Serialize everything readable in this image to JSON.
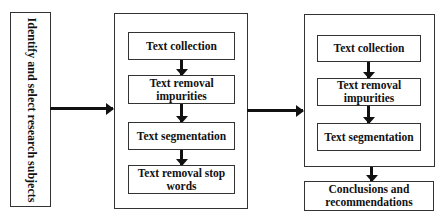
{
  "diagram": {
    "start": {
      "label": "Identify and select research subjects"
    },
    "middle_group": {
      "steps": [
        {
          "label": "Text collection"
        },
        {
          "label": "Text removal impurities"
        },
        {
          "label": "Text segmentation"
        },
        {
          "label": "Text removal stop words"
        }
      ]
    },
    "right_group": {
      "steps": [
        {
          "label": "Text collection"
        },
        {
          "label": "Text removal impurities"
        },
        {
          "label": "Text segmentation"
        }
      ]
    },
    "end": {
      "label": "Conclusions and recommendations"
    },
    "colors": {
      "stroke": "#333333",
      "arrow": "#111111",
      "background": "#ffffff"
    }
  }
}
